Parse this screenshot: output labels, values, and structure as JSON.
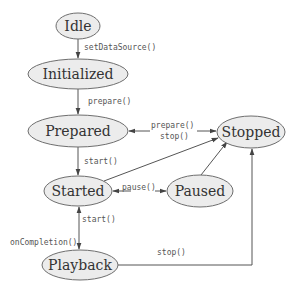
{
  "diagram": {
    "type": "state-machine",
    "nodes": {
      "idle": {
        "label": "Idle"
      },
      "initialized": {
        "label": "Initialized"
      },
      "prepared": {
        "label": "Prepared"
      },
      "started": {
        "label": "Started"
      },
      "paused": {
        "label": "Paused"
      },
      "stopped": {
        "label": "Stopped"
      },
      "playback": {
        "label": "Playback"
      }
    },
    "edges": {
      "idle_initialized": {
        "from": "Idle",
        "to": "Initialized",
        "label": "setDataSource()"
      },
      "initialized_prepared": {
        "from": "Initialized",
        "to": "Prepared",
        "label": "prepare()"
      },
      "stopped_prepared": {
        "from": "Stopped",
        "to": "Prepared",
        "label": "prepare()"
      },
      "prepared_stopped": {
        "from": "Prepared",
        "to": "Stopped",
        "label": "stop()"
      },
      "prepared_started": {
        "from": "Prepared",
        "to": "Started",
        "label": "start()"
      },
      "started_stopped": {
        "from": "Started",
        "to": "Stopped",
        "label": ""
      },
      "started_paused": {
        "from": "Started",
        "to": "Paused",
        "label": "pause()"
      },
      "paused_stopped": {
        "from": "Paused",
        "to": "Stopped",
        "label": ""
      },
      "playback_started": {
        "from": "Playback",
        "to": "Started",
        "label": "start()"
      },
      "started_playback": {
        "from": "Started",
        "to": "Playback",
        "label": "onCompletion()"
      },
      "playback_stopped": {
        "from": "Playback",
        "to": "Stopped",
        "label": "stop()"
      }
    }
  }
}
